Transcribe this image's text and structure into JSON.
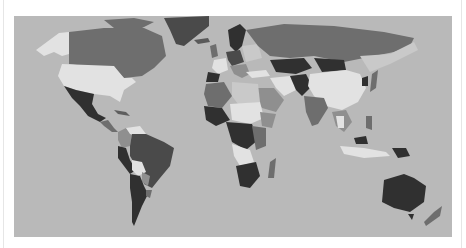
{
  "map": {
    "type": "choropleth-world-map",
    "projection": "equirectangular-like",
    "ocean_color": "#b9b9b9",
    "background_color": "#ffffff",
    "shades": {
      "lightest": "#e2e2e2",
      "light": "#c9c9c9",
      "medium": "#8f8f8f",
      "dark": "#5e5e5e",
      "darkest": "#303030"
    },
    "legend": null,
    "title": null
  }
}
